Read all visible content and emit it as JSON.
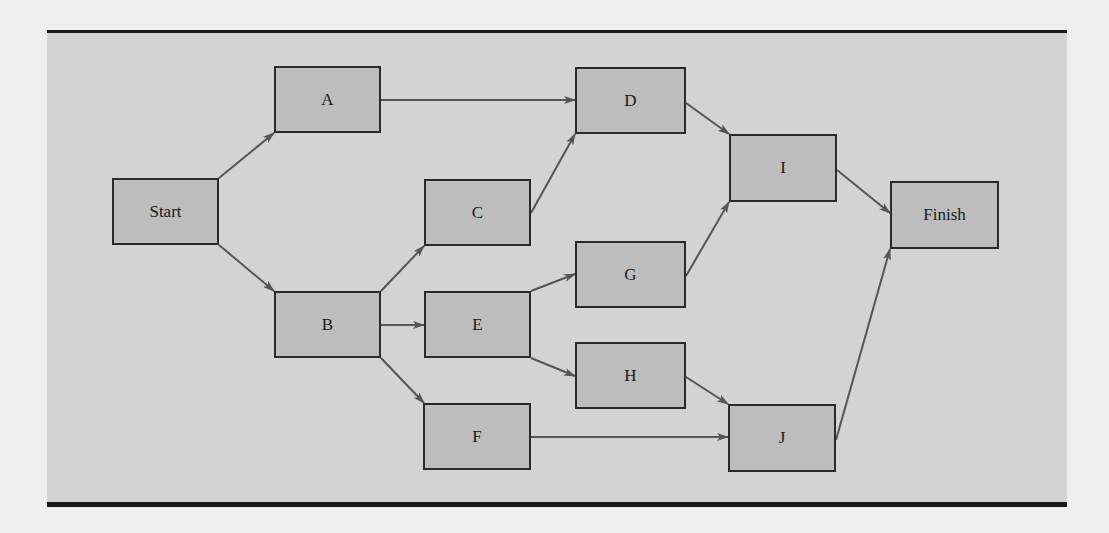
{
  "diagram": {
    "type": "network-precedence-diagram",
    "colors": {
      "page_background": "#efefef",
      "panel_background": "#d3d3d3",
      "node_fill": "#bdbdbd",
      "node_border": "#2a2a2a",
      "edge": "#555555",
      "rule": "#1a1a1a"
    },
    "nodes": [
      {
        "id": "start",
        "label": "Start",
        "x": 112,
        "y": 178,
        "w": 107,
        "h": 67
      },
      {
        "id": "a",
        "label": "A",
        "x": 274,
        "y": 66,
        "w": 107,
        "h": 67
      },
      {
        "id": "b",
        "label": "B",
        "x": 274,
        "y": 291,
        "w": 107,
        "h": 67
      },
      {
        "id": "c",
        "label": "C",
        "x": 424,
        "y": 179,
        "w": 107,
        "h": 67
      },
      {
        "id": "d",
        "label": "D",
        "x": 575,
        "y": 67,
        "w": 111,
        "h": 67
      },
      {
        "id": "e",
        "label": "E",
        "x": 424,
        "y": 291,
        "w": 107,
        "h": 67
      },
      {
        "id": "f",
        "label": "F",
        "x": 423,
        "y": 403,
        "w": 108,
        "h": 67
      },
      {
        "id": "g",
        "label": "G",
        "x": 575,
        "y": 241,
        "w": 111,
        "h": 67
      },
      {
        "id": "h",
        "label": "H",
        "x": 575,
        "y": 342,
        "w": 111,
        "h": 67
      },
      {
        "id": "i",
        "label": "I",
        "x": 729,
        "y": 134,
        "w": 108,
        "h": 68
      },
      {
        "id": "j",
        "label": "J",
        "x": 728,
        "y": 404,
        "w": 108,
        "h": 68
      },
      {
        "id": "finish",
        "label": "Finish",
        "x": 890,
        "y": 181,
        "w": 109,
        "h": 68
      }
    ],
    "edges": [
      {
        "from": "Start",
        "to": "A",
        "x1": 219,
        "y1": 178,
        "x2": 274,
        "y2": 133
      },
      {
        "from": "Start",
        "to": "B",
        "x1": 219,
        "y1": 245,
        "x2": 274,
        "y2": 291
      },
      {
        "from": "A",
        "to": "D",
        "x1": 381,
        "y1": 100,
        "x2": 575,
        "y2": 100
      },
      {
        "from": "B",
        "to": "C",
        "x1": 381,
        "y1": 291,
        "x2": 424,
        "y2": 246
      },
      {
        "from": "B",
        "to": "E",
        "x1": 381,
        "y1": 325,
        "x2": 424,
        "y2": 325
      },
      {
        "from": "B",
        "to": "F",
        "x1": 381,
        "y1": 358,
        "x2": 424,
        "y2": 403
      },
      {
        "from": "C",
        "to": "D",
        "x1": 531,
        "y1": 213,
        "x2": 575,
        "y2": 134
      },
      {
        "from": "E",
        "to": "G",
        "x1": 531,
        "y1": 291,
        "x2": 575,
        "y2": 274
      },
      {
        "from": "E",
        "to": "H",
        "x1": 531,
        "y1": 358,
        "x2": 575,
        "y2": 376
      },
      {
        "from": "D",
        "to": "I",
        "x1": 686,
        "y1": 103,
        "x2": 729,
        "y2": 134
      },
      {
        "from": "G",
        "to": "I",
        "x1": 686,
        "y1": 276,
        "x2": 729,
        "y2": 202
      },
      {
        "from": "H",
        "to": "J",
        "x1": 686,
        "y1": 377,
        "x2": 728,
        "y2": 404
      },
      {
        "from": "F",
        "to": "J",
        "x1": 531,
        "y1": 437,
        "x2": 728,
        "y2": 437
      },
      {
        "from": "I",
        "to": "Finish",
        "x1": 837,
        "y1": 170,
        "x2": 890,
        "y2": 213
      },
      {
        "from": "J",
        "to": "Finish",
        "x1": 836,
        "y1": 440,
        "x2": 890,
        "y2": 249
      }
    ]
  }
}
